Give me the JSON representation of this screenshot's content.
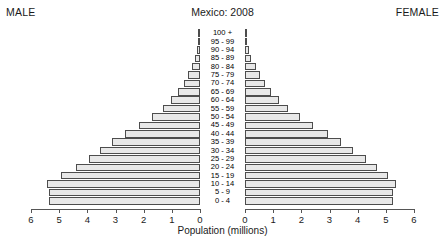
{
  "header": {
    "male_label": "MALE",
    "female_label": "FEMALE",
    "title": "Mexico: 2008"
  },
  "axis": {
    "caption": "Population (millions)",
    "tick_labels_left": [
      "6",
      "5",
      "4",
      "3",
      "2",
      "1",
      "0"
    ],
    "tick_labels_right": [
      "0",
      "1",
      "2",
      "3",
      "4",
      "5",
      "6"
    ],
    "max": 6,
    "min": 0
  },
  "colors": {
    "bar_fill": "#e8e8e8",
    "bar_stroke": "#4d4d4d",
    "axis": "#555555",
    "text": "#1a1a1a",
    "background": "#ffffff"
  },
  "chart_data": {
    "type": "bar",
    "subtype": "population-pyramid",
    "title": "Mexico: 2008",
    "xlabel": "Population (millions)",
    "ylabel": "",
    "xlim": [
      0,
      6
    ],
    "grid": false,
    "legend_position": "none",
    "orientation": "horizontal",
    "categories": [
      "100 +",
      "95 - 99",
      "90 - 94",
      "85 - 89",
      "80 - 84",
      "75 - 79",
      "70 - 74",
      "65 - 69",
      "60 - 64",
      "55 - 59",
      "50 - 54",
      "45 - 49",
      "40 - 44",
      "35 - 39",
      "30 - 34",
      "25 - 29",
      "20 - 24",
      "15 - 19",
      "10 - 14",
      "5 - 9",
      "0 - 4"
    ],
    "series": [
      {
        "name": "MALE",
        "side": "left",
        "values": [
          0.01,
          0.04,
          0.09,
          0.17,
          0.3,
          0.42,
          0.58,
          0.77,
          1.02,
          1.33,
          1.72,
          2.18,
          2.66,
          3.14,
          3.55,
          3.95,
          4.41,
          4.95,
          5.42,
          5.36,
          5.37
        ]
      },
      {
        "name": "FEMALE",
        "side": "right",
        "values": [
          0.02,
          0.06,
          0.13,
          0.23,
          0.38,
          0.52,
          0.7,
          0.91,
          1.19,
          1.53,
          1.95,
          2.43,
          2.93,
          3.42,
          3.85,
          4.28,
          4.7,
          5.08,
          5.36,
          5.24,
          5.24
        ]
      }
    ]
  }
}
